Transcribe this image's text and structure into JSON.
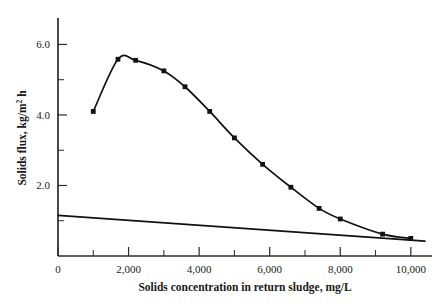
{
  "chart_data": {
    "type": "line",
    "title": "",
    "xlabel": "Solids concentration in return sludge, mg/L",
    "ylabel_main": "Solids flux, kg/m",
    "ylabel_sup": "2",
    "ylabel_tail": " h",
    "ylabel_full": "Solids flux, kg/m2 h",
    "xlim": [
      0,
      10600
    ],
    "ylim": [
      0,
      6.75
    ],
    "grid": false,
    "legend": "none",
    "x_major_ticks": [
      0,
      2000,
      4000,
      6000,
      8000,
      10000
    ],
    "x_major_tick_labels": [
      "0",
      "2,000",
      "4,000",
      "6,000",
      "8,000",
      "10,000"
    ],
    "x_minor_ticks": [
      1000,
      3000,
      5000,
      7000,
      9000
    ],
    "y_major_ticks": [
      2.0,
      4.0,
      6.0
    ],
    "y_major_tick_labels": [
      "2.0",
      "4.0",
      "6.0"
    ],
    "y_minor_ticks": [
      1.0,
      3.0,
      5.0
    ],
    "series": [
      {
        "name": "solids-flux-curve",
        "marker": "square",
        "x": [
          1000,
          1700,
          2200,
          3000,
          3600,
          4300,
          5000,
          5800,
          6600,
          7400,
          8000,
          9200,
          10000
        ],
        "y": [
          4.1,
          5.58,
          5.55,
          5.25,
          4.8,
          4.1,
          3.35,
          2.6,
          1.95,
          1.35,
          1.05,
          0.62,
          0.5
        ]
      },
      {
        "name": "underflow-line",
        "marker": "none",
        "x": [
          0,
          10400
        ],
        "y": [
          1.15,
          0.42
        ]
      }
    ]
  }
}
